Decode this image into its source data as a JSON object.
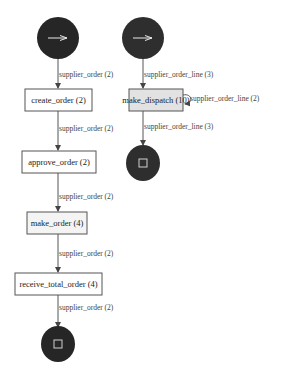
{
  "diagram": {
    "type": "process-flow",
    "colors": {
      "start_end_fill": "#262626",
      "box_fill": "#ffffff",
      "box_highlight_fill": "#e2e2e2",
      "box_stroke": "#555555",
      "edge_stroke": "#555555",
      "icon_stroke": "#d0d0d0"
    },
    "nodes": {
      "start_left": {
        "kind": "start",
        "icon": "arrow-right-icon"
      },
      "start_right": {
        "kind": "start",
        "icon": "arrow-right-icon"
      },
      "create_order": {
        "label": "create_order (2)"
      },
      "make_dispatch": {
        "label": "make_dispatch (10)"
      },
      "approve_order": {
        "label": "approve_order (2)"
      },
      "make_order": {
        "label": "make_order (4)"
      },
      "receive_total_order": {
        "label": "receive_total_order (4)"
      },
      "end_left": {
        "kind": "end",
        "icon": "stop-square-icon"
      },
      "end_right": {
        "kind": "end",
        "icon": "stop-square-icon"
      }
    },
    "edges": [
      {
        "from": "start_left",
        "to": "create_order",
        "label": "supplier_order (2)"
      },
      {
        "from": "create_order",
        "to": "approve_order",
        "label": "supplier_order (2)"
      },
      {
        "from": "approve_order",
        "to": "make_order",
        "label": "supplier_order (2)"
      },
      {
        "from": "make_order",
        "to": "receive_total_order",
        "label": "supplier_order (2)"
      },
      {
        "from": "receive_total_order",
        "to": "end_left",
        "label": "supplier_order (2)"
      },
      {
        "from": "start_right",
        "to": "make_dispatch",
        "label": "supplier_order_line (3)"
      },
      {
        "from": "make_dispatch",
        "to": "make_dispatch",
        "label": "supplier_order_line (2)"
      },
      {
        "from": "make_dispatch",
        "to": "end_right",
        "label": "supplier_order_line (3)"
      }
    ]
  }
}
